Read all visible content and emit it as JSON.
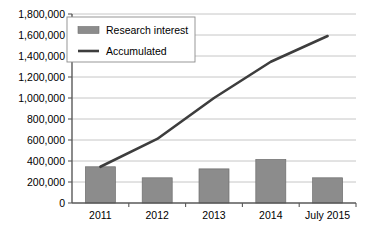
{
  "chart_data": {
    "type": "bar",
    "title": "",
    "subtitle": "",
    "xlabel": "",
    "ylabel": "",
    "categories": [
      "2011",
      "2012",
      "2013",
      "2014",
      "July 2015"
    ],
    "series": [
      {
        "name": "Research interest",
        "type": "bar",
        "values": [
          345000,
          240000,
          325000,
          415000,
          240000
        ],
        "color": "#8c8c8c"
      },
      {
        "name": "Accumulated",
        "type": "line",
        "values": [
          345000,
          610000,
          1000000,
          1345000,
          1590000
        ],
        "color": "#3d3d3d"
      }
    ],
    "ylim": [
      0,
      1800000
    ],
    "ytick_step": 200000,
    "ytick_labels": [
      "0",
      "200,000",
      "400,000",
      "600,000",
      "800,000",
      "1,000,000",
      "1,200,000",
      "1,400,000",
      "1,600,000",
      "1,800,000"
    ],
    "ytick_values": [
      0,
      200000,
      400000,
      600000,
      800000,
      1000000,
      1200000,
      1400000,
      1600000,
      1800000
    ],
    "grid": true,
    "grid_axis": "y",
    "legend_position": "top-left",
    "legend_entries": [
      {
        "label": "Research interest",
        "marker": "bar-swatch",
        "color": "#8c8c8c"
      },
      {
        "label": "Accumulated",
        "marker": "line-swatch",
        "color": "#3d3d3d"
      }
    ]
  },
  "colors": {
    "background": "#ffffff",
    "bar": "#8c8c8c",
    "bar_edge": "#6e6e6e",
    "line": "#3d3d3d",
    "gridline": "#b8b8b8",
    "axis": "#595959",
    "text": "#000000",
    "legend_border": "#8c8c8c"
  },
  "plot_geometry": {
    "left": 72,
    "right": 356,
    "top": 14,
    "bottom": 203,
    "bar_width": 30,
    "legend": {
      "x": 67,
      "y": 17,
      "width": 128,
      "height": 45
    }
  }
}
